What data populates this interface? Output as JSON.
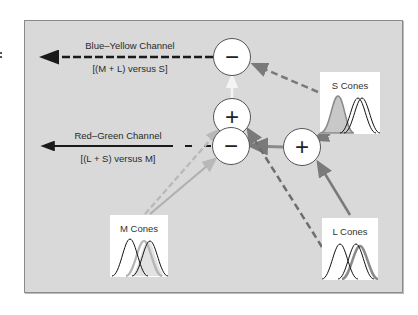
{
  "channels": {
    "blue_yellow": {
      "title": "Blue–Yellow Channel",
      "formula": "[(M + L) versus S]",
      "line_style": "dashed"
    },
    "red_green": {
      "title": "Red–Green Channel",
      "formula": "[(L + S) versus M]",
      "line_style": "solid"
    }
  },
  "nodes": {
    "by_minus": {
      "symbol": "−"
    },
    "by_plus": {
      "symbol": "+"
    },
    "rg_minus": {
      "symbol": "−"
    },
    "rg_plus": {
      "symbol": "+"
    }
  },
  "cones": {
    "s": {
      "label": "S Cones"
    },
    "m": {
      "label": "M Cones"
    },
    "l": {
      "label": "L Cones"
    }
  },
  "colors": {
    "background": "#d9d9d9",
    "frame_border": "#8a8a8a",
    "arrow_gray": "#7a7a7a",
    "arrow_light": "#b8b8b8",
    "output_black": "#1a1a1a",
    "highlight_fill": "#c8c8c8"
  }
}
